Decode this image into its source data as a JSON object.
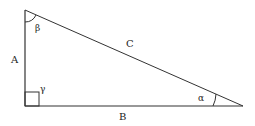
{
  "diagram": {
    "sides": {
      "a": "A",
      "b": "B",
      "c": "C"
    },
    "angles": {
      "alpha": "α",
      "beta": "β",
      "gamma": "γ"
    },
    "vertices": {
      "top": [
        25,
        10
      ],
      "right_angle": [
        25,
        106
      ],
      "right": [
        243,
        106
      ]
    },
    "colors": {
      "stroke": "#333333",
      "text": "#222222",
      "background": "#ffffff"
    }
  }
}
